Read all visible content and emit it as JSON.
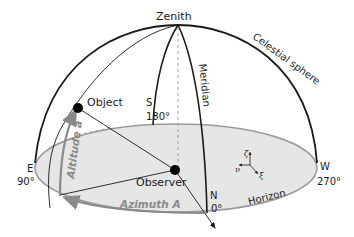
{
  "diagram": {
    "labels": {
      "zenith": "Zenith",
      "celestial_sphere": "Celestial sphere",
      "meridian": "Meridian",
      "object": "Object",
      "observer": "Observer",
      "horizon": "Horizon",
      "south": "S",
      "south_deg": "180°",
      "east": "E",
      "east_deg": "90°",
      "west": "W",
      "west_deg": "270°",
      "north": "N",
      "north_deg": "0°",
      "altitude": "Altitude a",
      "azimuth": "Azimuth A",
      "axis_zeta": "ζ",
      "axis_xi": "ξ",
      "axis_upsilon": "υ"
    },
    "colors": {
      "line": "#1a1a1a",
      "horizon_fill": "#e6e6e6",
      "horizon_edge": "#9a9a9a",
      "arrow_gray": "#8a8a8a"
    }
  }
}
